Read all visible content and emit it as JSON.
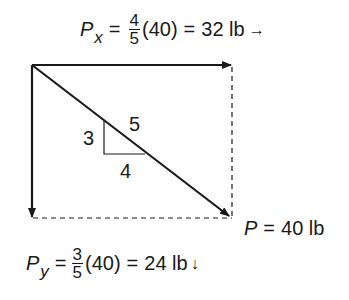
{
  "equations": {
    "px": {
      "symbol": "P",
      "subscript": "x",
      "equals1": "=",
      "frac_num": "4",
      "frac_den": "5",
      "paren": "(40)",
      "equals2": "=",
      "result": "32 lb",
      "direction_arrow": "→"
    },
    "py": {
      "symbol": "P",
      "subscript": "y",
      "equals1": "=",
      "frac_num": "3",
      "frac_den": "5",
      "paren": "(40)",
      "equals2": "=",
      "result": "24 lb",
      "direction_arrow": "↓"
    },
    "p": {
      "symbol": "P",
      "equals": "=",
      "value": "40 lb"
    }
  },
  "slope_triangle": {
    "rise": "3",
    "run": "4",
    "hypotenuse": "5"
  },
  "colors": {
    "stroke": "#1a1a1a",
    "background": "#ffffff"
  }
}
